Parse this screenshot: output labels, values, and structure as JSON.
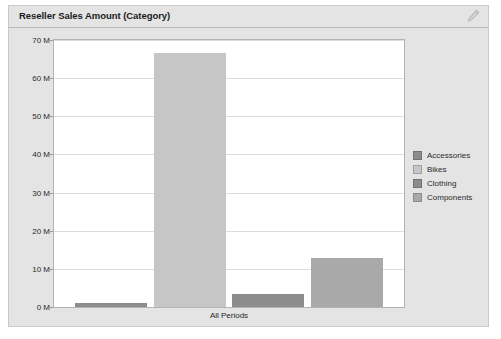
{
  "widget": {
    "title": "Reseller Sales Amount (Category)",
    "header_icon": "chart-settings-icon",
    "panel_bg": "#e4e4e4",
    "panel_border": "#c9c9c9",
    "plot_bg": "#ffffff",
    "plot_border": "#b3b3b3",
    "gridline_color": "#dcdcdc"
  },
  "chart_data": {
    "type": "bar",
    "title": "Reseller Sales Amount (Category)",
    "xlabel": "All Periods",
    "ylabel": "",
    "categories": [
      "All Periods"
    ],
    "series": [
      {
        "name": "Accessories",
        "values": [
          1.0
        ],
        "color": "#8c8c8c"
      },
      {
        "name": "Bikes",
        "values": [
          66.5
        ],
        "color": "#c6c6c6"
      },
      {
        "name": "Clothing",
        "values": [
          3.4
        ],
        "color": "#8c8c8c"
      },
      {
        "name": "Components",
        "values": [
          12.8
        ],
        "color": "#a9a9a9"
      }
    ],
    "ylim": [
      0,
      70
    ],
    "yticks": [
      0,
      10,
      20,
      30,
      40,
      50,
      60,
      70
    ],
    "ytick_labels": [
      "0 M",
      "10 M",
      "20 M",
      "30 M",
      "40 M",
      "50 M",
      "60 M",
      "70 M"
    ],
    "value_unit": "M",
    "grid": true,
    "legend_position": "right",
    "legend": [
      "Accessories",
      "Bikes",
      "Clothing",
      "Components"
    ]
  }
}
